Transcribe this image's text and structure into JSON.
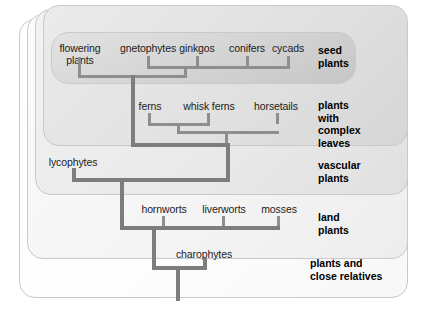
{
  "figure": {
    "type": "cladogram"
  },
  "groups": [
    {
      "id": "seed-plants",
      "label": "seed\nplants",
      "line1": "seed",
      "line2": "plants"
    },
    {
      "id": "complex-leaves",
      "label": "plants with complex leaves",
      "line1": "plants",
      "line2": "with",
      "line3": "complex",
      "line4": "leaves"
    },
    {
      "id": "vascular-plants",
      "label": "vascular plants",
      "line1": "vascular",
      "line2": "plants"
    },
    {
      "id": "land-plants",
      "label": "land plants",
      "line1": "land",
      "line2": "plants"
    },
    {
      "id": "plants-relatives",
      "label": "plants and close relatives",
      "line1": "plants and",
      "line2": "close relatives"
    }
  ],
  "taxa": [
    {
      "id": "flowering-plants",
      "label": "flowering plants",
      "line1": "flowering",
      "line2": "plants",
      "clade": "seed-plants"
    },
    {
      "id": "gnetophytes",
      "label": "gnetophytes",
      "clade": "seed-plants"
    },
    {
      "id": "ginkgos",
      "label": "ginkgos",
      "clade": "seed-plants"
    },
    {
      "id": "conifers",
      "label": "conifers",
      "clade": "seed-plants"
    },
    {
      "id": "cycads",
      "label": "cycads",
      "clade": "seed-plants"
    },
    {
      "id": "ferns",
      "label": "ferns",
      "clade": "complex-leaves"
    },
    {
      "id": "whisk-ferns",
      "label": "whisk ferns",
      "clade": "complex-leaves"
    },
    {
      "id": "horsetails",
      "label": "horsetails",
      "clade": "complex-leaves"
    },
    {
      "id": "lycophytes",
      "label": "lycophytes",
      "clade": "vascular-plants"
    },
    {
      "id": "hornworts",
      "label": "hornworts",
      "clade": "land-plants"
    },
    {
      "id": "liverworts",
      "label": "liverworts",
      "clade": "land-plants"
    },
    {
      "id": "mosses",
      "label": "mosses",
      "clade": "land-plants"
    },
    {
      "id": "charophytes",
      "label": "charophytes",
      "clade": "plants-relatives"
    }
  ],
  "colors": {
    "branch": "#8e8e8e",
    "text": "#1b1b1b",
    "group_text": "#000000",
    "box_border": "#c9c9c9",
    "background": "#ffffff"
  }
}
